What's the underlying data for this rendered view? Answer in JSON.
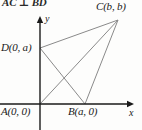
{
  "figure": {
    "header_note": "AC ⊥ BD",
    "axes": {
      "x_label": "x",
      "y_label": "y",
      "origin": [
        40,
        104
      ],
      "x_axis_end": [
        134,
        104
      ],
      "y_axis_top": [
        40,
        16
      ]
    },
    "points": {
      "A": {
        "label": "A(0, 0)",
        "x": 40,
        "y": 104
      },
      "B": {
        "label": "B(a, 0)",
        "x": 85,
        "y": 104
      },
      "C": {
        "label": "C(b, b)",
        "x": 118,
        "y": 20
      },
      "D": {
        "label": "D(0, a)",
        "x": 40,
        "y": 48
      }
    },
    "segments": [
      {
        "name": "D-C",
        "from": "D",
        "to": "C"
      },
      {
        "name": "A-C",
        "from": "A",
        "to": "C"
      },
      {
        "name": "B-C",
        "from": "B",
        "to": "C"
      },
      {
        "name": "D-B",
        "from": "D",
        "to": "B"
      }
    ],
    "colors": {
      "line": "#8a8a8a",
      "axis": "#1a1a1a",
      "text": "#1a1a1a",
      "background": "#fdfdfc"
    }
  }
}
